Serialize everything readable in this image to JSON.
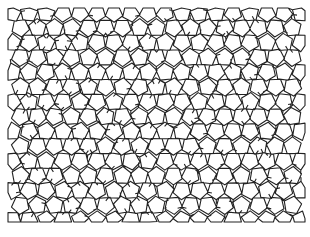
{
  "figure": {
    "stroke_color": "#222222",
    "background": "#ffffff",
    "region": {
      "x": 8,
      "y": 8,
      "width": 297,
      "height": 214
    }
  }
}
